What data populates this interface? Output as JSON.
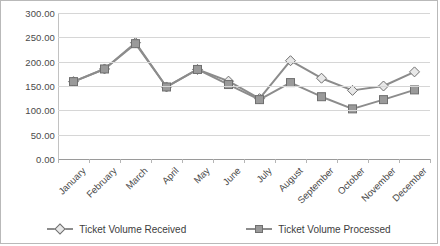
{
  "chart_data": {
    "type": "line",
    "title": "",
    "xlabel": "",
    "ylabel": "",
    "ylim": [
      0,
      300
    ],
    "grid": true,
    "legend_position": "bottom",
    "categories": [
      "January",
      "February",
      "March",
      "April",
      "May",
      "June",
      "July",
      "August",
      "September",
      "October",
      "November",
      "December"
    ],
    "y_ticks": [
      "0.00",
      "50.00",
      "100.00",
      "150.00",
      "200.00",
      "250.00",
      "300.00"
    ],
    "y_tick_values": [
      0,
      50,
      100,
      150,
      200,
      250,
      300
    ],
    "series": [
      {
        "name": "Ticket Volume Received",
        "marker": "diamond",
        "color": "#8c8c8c",
        "marker_fill": "#e8e8e8",
        "values": [
          159,
          185,
          239,
          148,
          184,
          160,
          124,
          202,
          166,
          141,
          150,
          179
        ]
      },
      {
        "name": "Ticket Volume Processed",
        "marker": "square",
        "color": "#8c8c8c",
        "marker_fill": "#9a9a9a",
        "values": [
          159,
          185,
          237,
          148,
          184,
          153,
          122,
          157,
          128,
          103,
          122,
          142
        ]
      }
    ]
  },
  "legend": {
    "items": [
      {
        "label": "Ticket Volume Received",
        "marker": "diamond"
      },
      {
        "label": "Ticket Volume Processed",
        "marker": "square"
      }
    ]
  }
}
